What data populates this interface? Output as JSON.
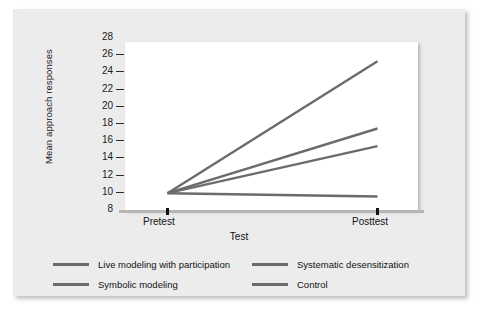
{
  "chart_data": {
    "type": "line",
    "title": "",
    "xlabel": "Test",
    "ylabel": "Mean approach responses",
    "categories": [
      "Pretest",
      "Posttest"
    ],
    "x_tick_labels": [
      "Pretest",
      "Posttest"
    ],
    "y_tick_labels": [
      "8",
      "10",
      "12",
      "14",
      "16",
      "18",
      "20",
      "22",
      "24",
      "26",
      "28"
    ],
    "y_ticks": [
      8,
      10,
      12,
      14,
      16,
      18,
      20,
      22,
      24,
      26,
      28
    ],
    "ylim": [
      8,
      28
    ],
    "grid": false,
    "legend_position": "bottom",
    "series": [
      {
        "name": "Live modeling with participation",
        "values": [
          10.0,
          25.7
        ],
        "color": "#6b6b6b"
      },
      {
        "name": "Symbolic modeling",
        "values": [
          10.0,
          17.7
        ],
        "color": "#6b6b6b"
      },
      {
        "name": "Systematic desensitization",
        "values": [
          10.0,
          15.6
        ],
        "color": "#6b6b6b"
      },
      {
        "name": "Control",
        "values": [
          10.0,
          9.6
        ],
        "color": "#6b6b6b"
      }
    ]
  },
  "axes": {
    "y_title": "Mean approach responses",
    "x_title": "Test",
    "y_labels": [
      "28",
      "26",
      "24",
      "22",
      "20",
      "18",
      "16",
      "14",
      "12",
      "10",
      "8"
    ],
    "x_labels": [
      "Pretest",
      "Posttest"
    ]
  },
  "legend": {
    "items": [
      {
        "label": "Live modeling with participation",
        "color": "#6b6b6b"
      },
      {
        "label": "Symbolic modeling",
        "color": "#6b6b6b"
      },
      {
        "label": "Systematic desensitization",
        "color": "#6b6b6b"
      },
      {
        "label": "Control",
        "color": "#6b6b6b"
      }
    ]
  },
  "colors": {
    "panel_background": "#ececed",
    "plot_background": "#ffffff",
    "line": "#6b6b6b",
    "axis": "#111111",
    "text": "#121212"
  }
}
